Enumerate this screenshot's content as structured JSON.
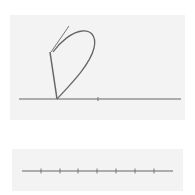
{
  "diagram": {
    "colors": {
      "background": "#ffffff",
      "panel": "#f3f3f3",
      "stroke": "#666666",
      "tick": "#777777"
    },
    "top_panel": {
      "baseline": {
        "x1": 19,
        "x2": 181,
        "y": 99
      },
      "ticks": [
        {
          "x": 98
        }
      ],
      "loop_path": "M57,99 C70,85 90,65 94,48 C97,35 90,30 82,31 C72,32 60,42 53,52",
      "straight_line": {
        "x1": 57,
        "y1": 99,
        "x2": 50,
        "y2": 52
      },
      "thin_stroke": {
        "x1": 51,
        "y1": 52,
        "x2": 69,
        "y2": 26
      }
    },
    "bottom_panel": {
      "number_line": {
        "x1": 22,
        "x2": 173,
        "y": 171
      },
      "ticks": [
        41,
        60,
        78,
        97,
        116,
        135,
        154
      ]
    }
  }
}
